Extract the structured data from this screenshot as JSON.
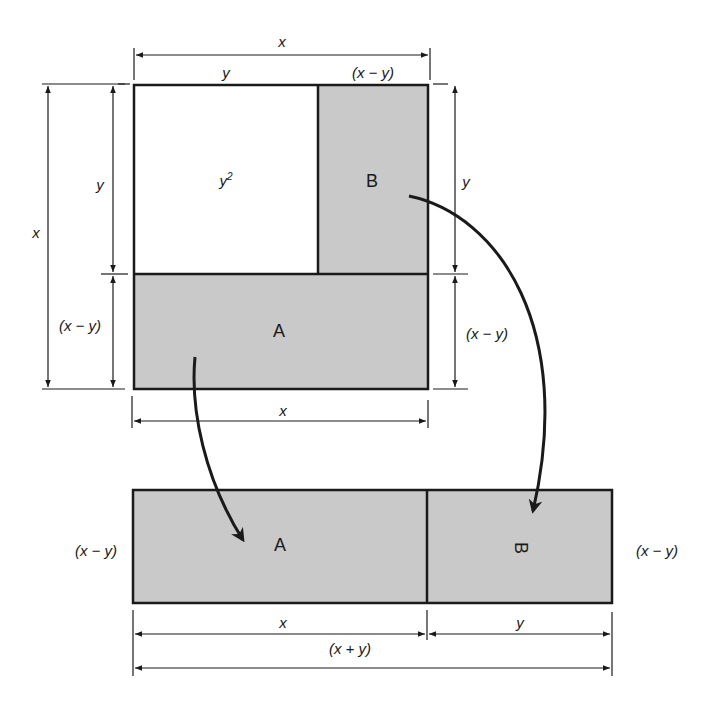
{
  "figure": {
    "colors": {
      "shade": "#c9c9c9",
      "stroke": "#1a1a1a",
      "background": "#ffffff"
    },
    "top_square": {
      "top_dim_outer": "x",
      "top_dim_left": "y",
      "top_dim_right": "(x − y)",
      "left_dim_outer": "x",
      "left_dim_upper": "y",
      "left_dim_lower": "(x − y)",
      "right_dim_upper": "y",
      "right_dim_lower": "(x − y)",
      "bottom_dim": "x",
      "region_white_label": "y",
      "region_white_exp": "2",
      "region_a_label": "A",
      "region_b_label": "B"
    },
    "bottom_rect": {
      "left_height_label": "(x − y)",
      "right_height_label": "(x − y)",
      "region_a_label": "A",
      "region_b_label": "B",
      "dim_a_width": "x",
      "dim_b_width": "y",
      "dim_total": "(x + y)"
    }
  }
}
